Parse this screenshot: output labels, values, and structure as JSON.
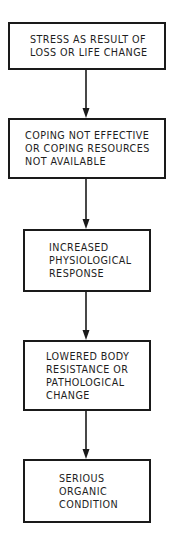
{
  "diagram": {
    "type": "flowchart",
    "direction": "top-to-bottom",
    "line_color": "#1a1a1a",
    "text_color": "#1e1e1e",
    "nodes": [
      {
        "id": "stress",
        "lines": [
          "STRESS AS RESULT OF",
          "LOSS OR LIFE CHANGE"
        ]
      },
      {
        "id": "coping",
        "lines": [
          "COPING NOT EFFECTIVE",
          "OR COPING RESOURCES",
          "NOT AVAILABLE"
        ]
      },
      {
        "id": "physiological",
        "lines": [
          "INCREASED",
          "PHYSIOLOGICAL",
          "RESPONSE"
        ]
      },
      {
        "id": "resistance",
        "lines": [
          "LOWERED BODY",
          "RESISTANCE OR",
          "PATHOLOGICAL",
          "CHANGE"
        ]
      },
      {
        "id": "organic",
        "lines": [
          "SERIOUS",
          "ORGANIC",
          "CONDITION"
        ]
      }
    ],
    "edges": [
      {
        "from": "stress",
        "to": "coping"
      },
      {
        "from": "coping",
        "to": "physiological"
      },
      {
        "from": "physiological",
        "to": "resistance"
      },
      {
        "from": "resistance",
        "to": "organic"
      }
    ]
  }
}
